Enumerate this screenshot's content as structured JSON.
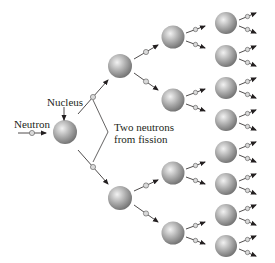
{
  "labels": {
    "neutron": "Neutron",
    "nucleus": "Nucleus",
    "fission_line1": "Two neutrons",
    "fission_line2": "from fission"
  },
  "colors": {
    "sphere_light": "#f2f2f2",
    "sphere_mid": "#a8a8a8",
    "sphere_dark": "#6e6e6e",
    "line": "#231f20",
    "neutron_fill": "#d9d9d9"
  },
  "nuclei": [
    {
      "id": "gen0",
      "cx": 65,
      "cy": 132,
      "r": 12
    },
    {
      "id": "gen1-a",
      "cx": 120,
      "cy": 66,
      "r": 12
    },
    {
      "id": "gen1-b",
      "cx": 120,
      "cy": 198,
      "r": 12
    },
    {
      "id": "gen2-a",
      "cx": 173,
      "cy": 37,
      "r": 11.5
    },
    {
      "id": "gen2-b",
      "cx": 173,
      "cy": 100,
      "r": 11.5
    },
    {
      "id": "gen2-c",
      "cx": 173,
      "cy": 173,
      "r": 11.5
    },
    {
      "id": "gen2-d",
      "cx": 173,
      "cy": 233,
      "r": 11.5
    },
    {
      "id": "gen3-a",
      "cx": 226,
      "cy": 23,
      "r": 11
    },
    {
      "id": "gen3-b",
      "cx": 226,
      "cy": 56,
      "r": 11
    },
    {
      "id": "gen3-c",
      "cx": 226,
      "cy": 88,
      "r": 11
    },
    {
      "id": "gen3-d",
      "cx": 226,
      "cy": 120,
      "r": 11
    },
    {
      "id": "gen3-e",
      "cx": 226,
      "cy": 152,
      "r": 11
    },
    {
      "id": "gen3-f",
      "cx": 226,
      "cy": 184,
      "r": 11
    },
    {
      "id": "gen3-g",
      "cx": 226,
      "cy": 215,
      "r": 11
    },
    {
      "id": "gen3-h",
      "cx": 226,
      "cy": 246,
      "r": 11
    }
  ],
  "neutrons": [
    {
      "x1": 18,
      "y1": 133,
      "x2": 46,
      "y2": 133
    },
    {
      "x1": 78,
      "y1": 114,
      "x2": 108,
      "y2": 80
    },
    {
      "x1": 78,
      "y1": 150,
      "x2": 108,
      "y2": 184
    },
    {
      "x1": 134,
      "y1": 59,
      "x2": 158,
      "y2": 45
    },
    {
      "x1": 134,
      "y1": 73,
      "x2": 158,
      "y2": 90
    },
    {
      "x1": 134,
      "y1": 191,
      "x2": 158,
      "y2": 180
    },
    {
      "x1": 134,
      "y1": 205,
      "x2": 158,
      "y2": 222
    }
  ],
  "small_neutron_offsets": [
    {
      "dx1": 13,
      "dy1": -3,
      "dx2": 30,
      "dy2": -10
    },
    {
      "dx1": 13,
      "dy1": 3,
      "dx2": 30,
      "dy2": 10
    }
  ],
  "gen2_child_offsets": [
    {
      "dx1": 13,
      "dy1": -4,
      "dx2": 32,
      "dy2": -11
    },
    {
      "dx1": 13,
      "dy1": 4,
      "dx2": 32,
      "dy2": 11
    }
  ],
  "bracket": {
    "top": [
      93,
      100
    ],
    "vertex": [
      108,
      132
    ],
    "bottom": [
      93,
      162
    ]
  },
  "nucleus_pointer": {
    "x1": 64,
    "y1": 107,
    "x2": 64,
    "y2": 120
  }
}
